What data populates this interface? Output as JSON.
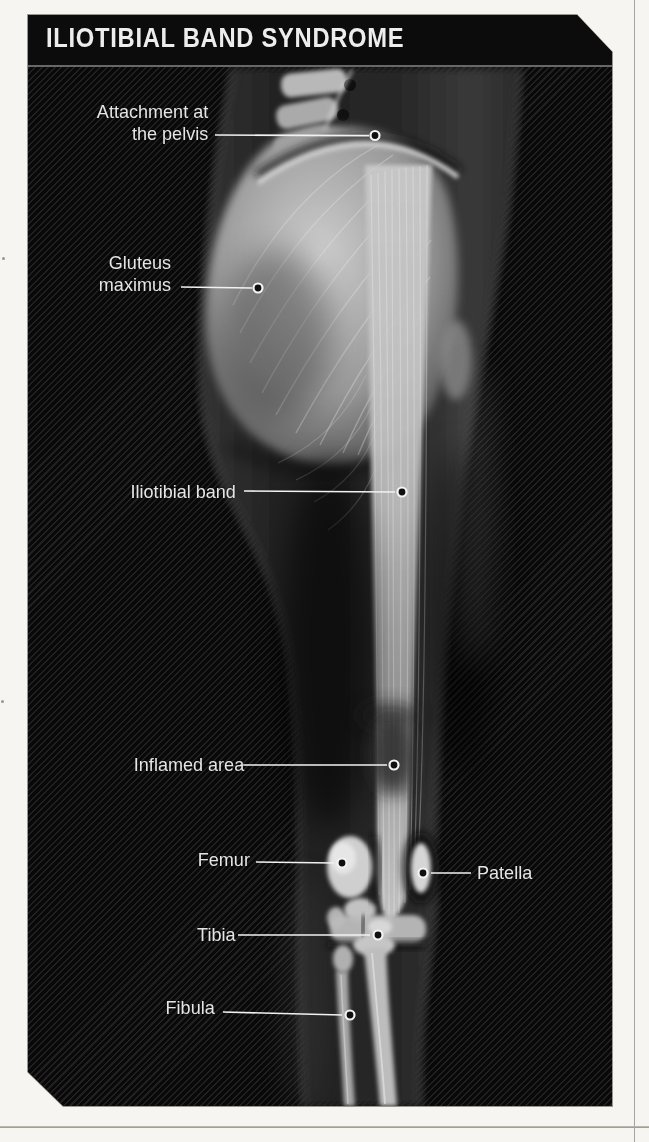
{
  "title": "ILIOTIBIAL BAND SYNDROME",
  "labels": [
    {
      "id": "attachment-pelvis",
      "lines": [
        "Attachment at",
        "the pelvis"
      ]
    },
    {
      "id": "gluteus-maximus",
      "lines": [
        "Gluteus",
        "maximus"
      ]
    },
    {
      "id": "iliotibial-band",
      "lines": [
        "Iliotibial band"
      ]
    },
    {
      "id": "inflamed-area",
      "lines": [
        "Inflamed area"
      ]
    },
    {
      "id": "femur",
      "lines": [
        "Femur"
      ]
    },
    {
      "id": "patella",
      "lines": [
        "Patella"
      ]
    },
    {
      "id": "tibia",
      "lines": [
        "Tibia"
      ]
    },
    {
      "id": "fibula",
      "lines": [
        "Fibula"
      ]
    }
  ],
  "colors": {
    "page_background": "#f6f5f1",
    "panel_background": "#090909",
    "panel_stripe": "#343434",
    "header_background": "#0c0c0c",
    "title_text": "#ededed",
    "label_text": "#e5e5e5",
    "leader_line": "#f2f2f2"
  }
}
